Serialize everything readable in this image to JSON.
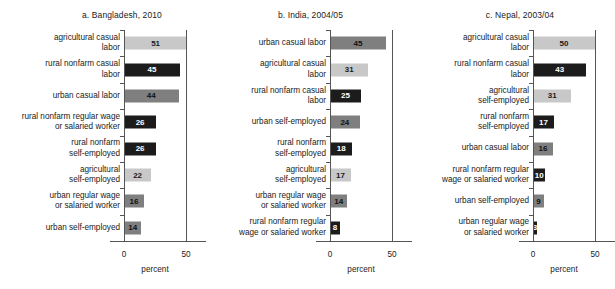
{
  "figure": {
    "axis_title": "percent",
    "tick_labels": [
      "0",
      "50"
    ],
    "xlim_max": 50,
    "colors": {
      "light": "#c8c8c8",
      "mid": "#7f7f7f",
      "dark": "#1c1c1c",
      "axis": "#555555",
      "text": "#1a1a1a"
    }
  },
  "panels": [
    {
      "title": "a. Bangladesh, 2010",
      "rows": [
        {
          "label": "agricultural casual\nlabor",
          "value": 51,
          "shade": "light"
        },
        {
          "label": "rural nonfarm casual\nlabor",
          "value": 45,
          "shade": "dark"
        },
        {
          "label": "urban casual labor",
          "value": 44,
          "shade": "mid"
        },
        {
          "label": "rural nonfarm regular wage\nor salaried worker",
          "value": 26,
          "shade": "dark"
        },
        {
          "label": "rural nonfarm\nself-employed",
          "value": 26,
          "shade": "dark"
        },
        {
          "label": "agricultural\nself-employed",
          "value": 22,
          "shade": "light"
        },
        {
          "label": "urban regular wage\nor salaried worker",
          "value": 16,
          "shade": "mid"
        },
        {
          "label": "urban self-employed",
          "value": 14,
          "shade": "mid"
        }
      ]
    },
    {
      "title": "b. India, 2004/05",
      "rows": [
        {
          "label": "urban casual labor",
          "value": 45,
          "shade": "mid"
        },
        {
          "label": "agricultural casual\nlabor",
          "value": 31,
          "shade": "light"
        },
        {
          "label": "rural nonfarm casual\nlabor",
          "value": 25,
          "shade": "dark"
        },
        {
          "label": "urban self-employed",
          "value": 24,
          "shade": "mid"
        },
        {
          "label": "rural nonfarm\nself-employed",
          "value": 18,
          "shade": "dark"
        },
        {
          "label": "agricultural\nself-employed",
          "value": 17,
          "shade": "light"
        },
        {
          "label": "urban regular wage\nor salaried worker",
          "value": 14,
          "shade": "mid"
        },
        {
          "label": "rural nonfarm regular\nwage or salaried worker",
          "value": 8,
          "shade": "dark"
        }
      ]
    },
    {
      "title": "c. Nepal, 2003/04",
      "rows": [
        {
          "label": "agricultural casual\nlabor",
          "value": 50,
          "shade": "light"
        },
        {
          "label": "rural nonfarm casual\nlabor",
          "value": 43,
          "shade": "dark"
        },
        {
          "label": "agricultural\nself-employed",
          "value": 31,
          "shade": "light"
        },
        {
          "label": "rural nonfarm\nself-employed",
          "value": 17,
          "shade": "dark"
        },
        {
          "label": "urban casual labor",
          "value": 16,
          "shade": "mid"
        },
        {
          "label": "rural nonfarm regular\nwage or salaried worker",
          "value": 10,
          "shade": "dark"
        },
        {
          "label": "urban self-employed",
          "value": 9,
          "shade": "mid"
        },
        {
          "label": "urban regular wage\nor salaried worker",
          "value": 3,
          "shade": "dark"
        }
      ]
    }
  ],
  "chart_data": {
    "type": "bar",
    "title": "",
    "orientation": "horizontal",
    "xlabel": "percent",
    "ylabel": "",
    "xlim": [
      0,
      50
    ],
    "grid": false,
    "legend": "none",
    "xticks": [
      0,
      50
    ],
    "panels": [
      {
        "title": "a. Bangladesh, 2010",
        "categories": [
          "agricultural casual labor",
          "rural nonfarm casual labor",
          "urban casual labor",
          "rural nonfarm regular wage or salaried worker",
          "rural nonfarm self-employed",
          "agricultural self-employed",
          "urban regular wage or salaried worker",
          "urban self-employed"
        ],
        "values": [
          51,
          45,
          44,
          26,
          26,
          22,
          16,
          14
        ],
        "shades": [
          "light",
          "dark",
          "mid",
          "dark",
          "dark",
          "light",
          "mid",
          "mid"
        ]
      },
      {
        "title": "b. India, 2004/05",
        "categories": [
          "urban casual labor",
          "agricultural casual labor",
          "rural nonfarm casual labor",
          "urban self-employed",
          "rural nonfarm self-employed",
          "agricultural self-employed",
          "urban regular wage or salaried worker",
          "rural nonfarm regular wage or salaried worker"
        ],
        "values": [
          45,
          31,
          25,
          24,
          18,
          17,
          14,
          8
        ],
        "shades": [
          "mid",
          "light",
          "dark",
          "mid",
          "dark",
          "light",
          "mid",
          "dark"
        ]
      },
      {
        "title": "c. Nepal, 2003/04",
        "categories": [
          "agricultural casual labor",
          "rural nonfarm casual labor",
          "agricultural self-employed",
          "rural nonfarm self-employed",
          "urban casual labor",
          "rural nonfarm regular wage or salaried worker",
          "urban self-employed",
          "urban regular wage or salaried worker"
        ],
        "values": [
          50,
          43,
          31,
          17,
          16,
          10,
          9,
          3
        ],
        "shades": [
          "light",
          "dark",
          "light",
          "dark",
          "mid",
          "dark",
          "mid",
          "dark"
        ]
      }
    ]
  }
}
